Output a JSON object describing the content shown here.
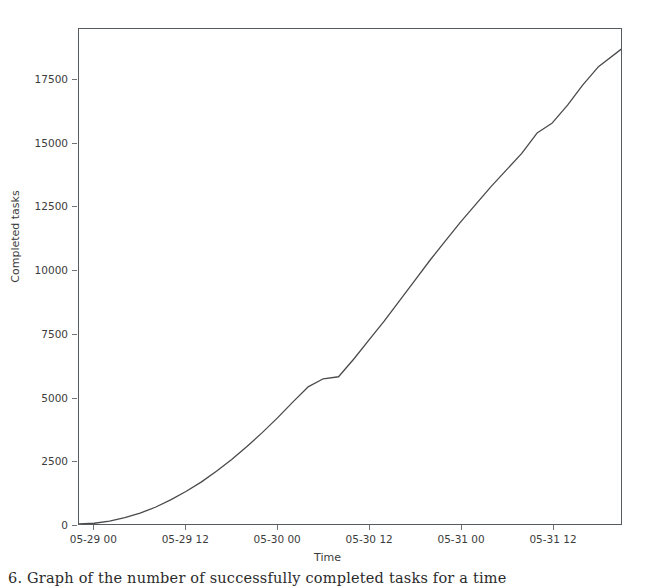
{
  "figure": {
    "caption": "6. Graph of the number of successfully completed tasks for a time",
    "line_color": "#4a4a4a",
    "axis_color": "#555b5e",
    "background": "#ffffff"
  },
  "chart_data": {
    "type": "line",
    "title": "",
    "xlabel": "Time",
    "ylabel": "Completed tasks",
    "grid": false,
    "legend": false,
    "xtick_labels": [
      "05-29 00",
      "05-29 12",
      "05-30 00",
      "05-30 12",
      "05-31 00",
      "05-31 12"
    ],
    "ytick_labels": [
      "0",
      "2500",
      "5000",
      "7500",
      "10000",
      "12500",
      "15000",
      "17500"
    ],
    "ytick_values": [
      0,
      2500,
      5000,
      7500,
      10000,
      12500,
      15000,
      17500
    ],
    "ylim": [
      0,
      19500
    ],
    "xlim_labels": [
      "05-28 22",
      "05-31 21"
    ],
    "series": [
      {
        "name": "Completed tasks",
        "color": "#4a4a4a",
        "x": [
          "05-28 22",
          "05-29 00",
          "05-29 02",
          "05-29 04",
          "05-29 06",
          "05-29 08",
          "05-29 10",
          "05-29 12",
          "05-29 14",
          "05-29 16",
          "05-29 18",
          "05-29 20",
          "05-29 22",
          "05-30 00",
          "05-30 02",
          "05-30 04",
          "05-30 06",
          "05-30 08",
          "05-30 10",
          "05-30 12",
          "05-30 14",
          "05-30 16",
          "05-30 18",
          "05-30 20",
          "05-30 22",
          "05-31 00",
          "05-31 02",
          "05-31 04",
          "05-31 06",
          "05-31 08",
          "05-31 10",
          "05-31 12",
          "05-31 14",
          "05-31 16",
          "05-31 18",
          "05-31 21"
        ],
        "values": [
          0,
          30,
          110,
          250,
          430,
          660,
          950,
          1280,
          1650,
          2080,
          2540,
          3050,
          3600,
          4180,
          4800,
          5400,
          5720,
          5800,
          6500,
          7250,
          8000,
          8800,
          9600,
          10400,
          11150,
          11900,
          12600,
          13300,
          13950,
          14600,
          15400,
          15800,
          16500,
          17300,
          18000,
          18700
        ]
      }
    ]
  }
}
